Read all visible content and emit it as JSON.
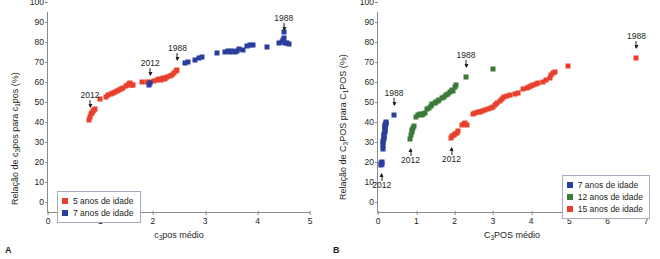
{
  "figure": {
    "panel_a_letter": "A",
    "panel_b_letter": "B"
  },
  "panel_a": {
    "ylabel_prefix": "Relação de c",
    "ylabel_sub1": "3",
    "ylabel_mid": "pos para c",
    "ylabel_sub2": "1",
    "ylabel_suffix": "pos (%)",
    "xlabel_prefix": "c",
    "xlabel_sub": "3",
    "xlabel_suffix": "pos médio",
    "yticks": [
      "0",
      "10",
      "20",
      "30",
      "40",
      "50",
      "60",
      "70",
      "80",
      "90",
      "100"
    ],
    "xticks": [
      "0",
      "1",
      "2",
      "3",
      "4",
      "5"
    ],
    "annotations": [
      {
        "text": "2012",
        "series": "5 anos de idade"
      },
      {
        "text": "2012",
        "series": "7 anos de idade"
      },
      {
        "text": "1988",
        "series": "5 anos de idade"
      },
      {
        "text": "1988",
        "series": "7 anos de idade"
      }
    ],
    "legend": [
      {
        "label": "5 anos de idade",
        "color": "#E8402A"
      },
      {
        "label": "7 anos de idade",
        "color": "#2A3E9E"
      }
    ]
  },
  "panel_b": {
    "ylabel_prefix": "Relação de C",
    "ylabel_sub1": "3",
    "ylabel_mid": "POS para C",
    "ylabel_sub2": "1",
    "ylabel_suffix": "POS (%)",
    "xlabel_prefix": "C",
    "xlabel_sub": "3",
    "xlabel_suffix": "POS médio",
    "yticks": [
      "0",
      "10",
      "20",
      "30",
      "40",
      "50",
      "60",
      "70",
      "80",
      "90",
      "100"
    ],
    "xticks": [
      "0",
      "1",
      "2",
      "3",
      "4",
      "5",
      "6",
      "7"
    ],
    "annotations": [
      {
        "text": "2012",
        "series": "7 anos de idade"
      },
      {
        "text": "1988",
        "series": "7 anos de idade"
      },
      {
        "text": "2012",
        "series": "12 anos de idade"
      },
      {
        "text": "1988",
        "series": "12 anos de idade"
      },
      {
        "text": "2012",
        "series": "15 anos de idade"
      },
      {
        "text": "1988",
        "series": "15 anos de idade"
      }
    ],
    "legend": [
      {
        "label": "7 anos de idade",
        "color": "#2A3E9E"
      },
      {
        "label": "12 anos de idade",
        "color": "#3A7A3A"
      },
      {
        "label": "15 anos de idade",
        "color": "#E8402A"
      }
    ]
  },
  "chart_data": [
    {
      "type": "scatter",
      "panel": "A",
      "title": "",
      "xlabel": "c3pos médio",
      "ylabel": "Relação de c3pos para c1pos (%)",
      "xlim": [
        0,
        5
      ],
      "ylim": [
        0,
        100
      ],
      "xticks": [
        0,
        1,
        2,
        3,
        4,
        5
      ],
      "yticks": [
        0,
        10,
        20,
        30,
        40,
        50,
        60,
        70,
        80,
        90,
        100
      ],
      "grid": false,
      "legend_position": "lower-left",
      "annotations": [
        {
          "text": "2012",
          "x": 0.8,
          "y": 47.5
        },
        {
          "text": "1988",
          "x": 2.47,
          "y": 71.0
        },
        {
          "text": "2012",
          "x": 1.95,
          "y": 63.5
        },
        {
          "text": "1988",
          "x": 4.5,
          "y": 86.0
        }
      ],
      "series": [
        {
          "name": "5 anos de idade",
          "color": "#E8402A",
          "points": [
            [
              0.78,
              46.0
            ],
            [
              0.8,
              47.5
            ],
            [
              0.82,
              49.0
            ],
            [
              0.84,
              49.5
            ],
            [
              0.86,
              50.5
            ],
            [
              0.88,
              51.0
            ],
            [
              0.9,
              51.5
            ],
            [
              1.0,
              56.5
            ],
            [
              1.1,
              57.5
            ],
            [
              1.15,
              58.5
            ],
            [
              1.2,
              59.0
            ],
            [
              1.24,
              59.5
            ],
            [
              1.28,
              60.0
            ],
            [
              1.32,
              60.5
            ],
            [
              1.36,
              61.0
            ],
            [
              1.4,
              61.5
            ],
            [
              1.44,
              62.0
            ],
            [
              1.48,
              63.0
            ],
            [
              1.52,
              63.5
            ],
            [
              1.55,
              64.0
            ],
            [
              1.57,
              64.5
            ],
            [
              1.6,
              63.5
            ],
            [
              1.63,
              63.5
            ],
            [
              1.8,
              65.0
            ],
            [
              1.88,
              65.0
            ],
            [
              1.95,
              65.0
            ],
            [
              2.02,
              65.5
            ],
            [
              2.08,
              66.0
            ],
            [
              2.12,
              66.5
            ],
            [
              2.16,
              66.0
            ],
            [
              2.2,
              67.0
            ],
            [
              2.24,
              66.5
            ],
            [
              2.28,
              67.5
            ],
            [
              2.32,
              68.0
            ],
            [
              2.36,
              68.5
            ],
            [
              2.4,
              69.5
            ],
            [
              2.44,
              70.5
            ],
            [
              2.47,
              71.0
            ]
          ]
        },
        {
          "name": "7 anos de idade",
          "color": "#2A3E9E",
          "points": [
            [
              1.93,
              63.5
            ],
            [
              1.95,
              64.5
            ],
            [
              2.62,
              74.5
            ],
            [
              2.68,
              75.0
            ],
            [
              2.8,
              76.0
            ],
            [
              2.88,
              77.0
            ],
            [
              2.94,
              77.5
            ],
            [
              3.22,
              79.5
            ],
            [
              3.38,
              80.0
            ],
            [
              3.44,
              80.5
            ],
            [
              3.48,
              80.0
            ],
            [
              3.52,
              80.5
            ],
            [
              3.56,
              80.0
            ],
            [
              3.6,
              80.5
            ],
            [
              3.64,
              81.5
            ],
            [
              3.72,
              81.0
            ],
            [
              3.8,
              83.0
            ],
            [
              3.86,
              83.5
            ],
            [
              3.92,
              83.5
            ],
            [
              4.18,
              82.5
            ],
            [
              4.4,
              84.5
            ],
            [
              4.46,
              85.0
            ],
            [
              4.48,
              86.0
            ],
            [
              4.5,
              87.0
            ],
            [
              4.5,
              90.0
            ],
            [
              4.52,
              84.5
            ],
            [
              4.56,
              84.5
            ],
            [
              4.6,
              84.0
            ]
          ]
        }
      ]
    },
    {
      "type": "scatter",
      "panel": "B",
      "title": "",
      "xlabel": "C3POS médio",
      "ylabel": "Relação de C3POS para C1POS (%)",
      "xlim": [
        0,
        7
      ],
      "ylim": [
        0,
        100
      ],
      "xticks": [
        0,
        1,
        2,
        3,
        4,
        5,
        6,
        7
      ],
      "yticks": [
        0,
        10,
        20,
        30,
        40,
        50,
        60,
        70,
        80,
        90,
        100
      ],
      "grid": false,
      "legend_position": "lower-right",
      "annotations": [
        {
          "text": "2012",
          "x": 0.1,
          "y": 24.0
        },
        {
          "text": "1988",
          "x": 0.42,
          "y": 48.5
        },
        {
          "text": "2012",
          "x": 0.85,
          "y": 36.5
        },
        {
          "text": "1988",
          "x": 2.3,
          "y": 67.5
        },
        {
          "text": "2012",
          "x": 1.92,
          "y": 37.0
        },
        {
          "text": "1988",
          "x": 6.75,
          "y": 77.0
        }
      ],
      "series": [
        {
          "name": "7 anos de idade",
          "color": "#2A3E9E",
          "points": [
            [
              0.08,
              23.5
            ],
            [
              0.09,
              24.5
            ],
            [
              0.1,
              25.0
            ],
            [
              0.11,
              24.0
            ],
            [
              0.12,
              31.5
            ],
            [
              0.13,
              33.0
            ],
            [
              0.14,
              34.5
            ],
            [
              0.14,
              35.5
            ],
            [
              0.15,
              36.5
            ],
            [
              0.15,
              37.5
            ],
            [
              0.16,
              38.0
            ],
            [
              0.16,
              39.0
            ],
            [
              0.17,
              40.0
            ],
            [
              0.17,
              41.0
            ],
            [
              0.18,
              41.5
            ],
            [
              0.18,
              42.5
            ],
            [
              0.19,
              43.0
            ],
            [
              0.19,
              43.5
            ],
            [
              0.2,
              44.0
            ],
            [
              0.2,
              44.5
            ],
            [
              0.21,
              45.0
            ],
            [
              0.42,
              48.5
            ]
          ]
        },
        {
          "name": "12 anos de idade",
          "color": "#3A7A3A",
          "points": [
            [
              0.84,
              36.5
            ],
            [
              0.86,
              38.5
            ],
            [
              0.88,
              40.0
            ],
            [
              0.9,
              41.0
            ],
            [
              0.92,
              42.0
            ],
            [
              0.95,
              43.0
            ],
            [
              1.0,
              47.5
            ],
            [
              1.05,
              48.5
            ],
            [
              1.1,
              49.0
            ],
            [
              1.14,
              48.5
            ],
            [
              1.18,
              49.0
            ],
            [
              1.22,
              49.5
            ],
            [
              1.28,
              51.5
            ],
            [
              1.32,
              52.0
            ],
            [
              1.38,
              53.0
            ],
            [
              1.42,
              54.0
            ],
            [
              1.48,
              54.5
            ],
            [
              1.52,
              55.0
            ],
            [
              1.56,
              55.5
            ],
            [
              1.6,
              56.0
            ],
            [
              1.66,
              57.0
            ],
            [
              1.72,
              57.5
            ],
            [
              1.78,
              58.5
            ],
            [
              1.84,
              59.0
            ],
            [
              1.88,
              60.0
            ],
            [
              1.92,
              61.0
            ],
            [
              1.96,
              60.5
            ],
            [
              2.0,
              62.5
            ],
            [
              2.04,
              63.5
            ],
            [
              2.3,
              67.5
            ],
            [
              3.0,
              71.5
            ]
          ]
        },
        {
          "name": "15 anos de idade",
          "color": "#E8402A",
          "points": [
            [
              1.9,
              37.0
            ],
            [
              1.94,
              38.0
            ],
            [
              1.98,
              38.5
            ],
            [
              2.02,
              39.0
            ],
            [
              2.06,
              39.5
            ],
            [
              2.1,
              40.5
            ],
            [
              2.2,
              43.5
            ],
            [
              2.24,
              44.0
            ],
            [
              2.28,
              44.5
            ],
            [
              2.32,
              43.5
            ],
            [
              2.48,
              49.0
            ],
            [
              2.54,
              49.5
            ],
            [
              2.6,
              50.0
            ],
            [
              2.66,
              50.0
            ],
            [
              2.72,
              50.5
            ],
            [
              2.8,
              51.0
            ],
            [
              2.88,
              51.5
            ],
            [
              2.94,
              52.0
            ],
            [
              3.0,
              52.5
            ],
            [
              3.06,
              53.5
            ],
            [
              3.12,
              54.5
            ],
            [
              3.18,
              55.5
            ],
            [
              3.24,
              56.5
            ],
            [
              3.3,
              57.5
            ],
            [
              3.36,
              58.0
            ],
            [
              3.44,
              58.5
            ],
            [
              3.58,
              59.0
            ],
            [
              3.66,
              59.5
            ],
            [
              3.8,
              61.5
            ],
            [
              3.88,
              62.0
            ],
            [
              3.94,
              62.5
            ],
            [
              4.0,
              63.0
            ],
            [
              4.06,
              63.5
            ],
            [
              4.12,
              64.0
            ],
            [
              4.18,
              64.5
            ],
            [
              4.3,
              65.0
            ],
            [
              4.4,
              66.0
            ],
            [
              4.48,
              67.0
            ],
            [
              4.52,
              68.5
            ],
            [
              4.58,
              69.5
            ],
            [
              4.62,
              70.0
            ],
            [
              4.96,
              73.0
            ],
            [
              6.75,
              77.0
            ]
          ]
        }
      ]
    }
  ]
}
